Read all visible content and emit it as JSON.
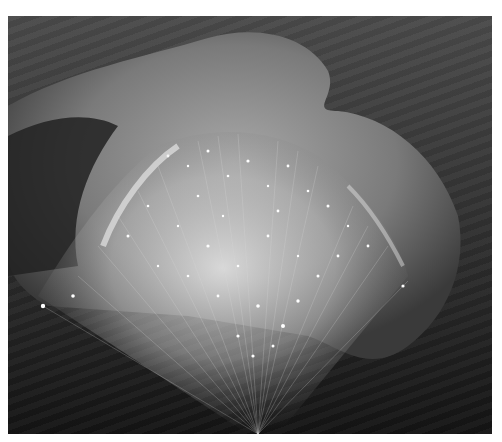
{
  "image": {
    "description": "Grayscale photograph of a cupped hand holding a bundle of glowing fiber optic strands fanning upward",
    "colors": {
      "border": "#ffffff",
      "background_top": "#4a4a4a",
      "background_bottom": "#141414",
      "hand": "#8a8a8a",
      "glow": "#f4f4f4"
    }
  }
}
